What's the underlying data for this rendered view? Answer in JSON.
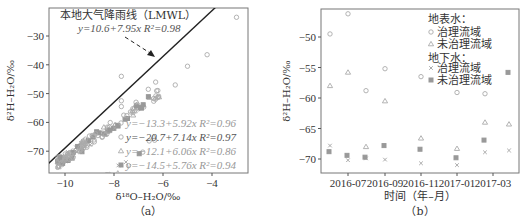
{
  "chart_data": [
    {
      "panel": "a",
      "type": "scatter",
      "panel_label": "（a）",
      "xlabel": "δ¹⁸O–H₂O/‰",
      "ylabel": "δ²H–H₂O/‰",
      "xlim": [
        -10.7,
        -2.6
      ],
      "ylim": [
        -76,
        -21
      ],
      "xticks": [
        "-10",
        "-8",
        "-6",
        "-4"
      ],
      "yticks": [
        "-30",
        "-40",
        "-50",
        "-60",
        "-70"
      ],
      "lmwl": {
        "label": "本地大气降雨线（LMWL）",
        "equation": "y=10.6+7.95x",
        "r2": "R²=0.98",
        "intercept": 10.6,
        "slope": 7.95
      },
      "regressions": [
        {
          "equation": "y=−13.3+5.92x",
          "r2": "R²=0.96",
          "intercept": -13.3,
          "slope": 5.92,
          "marker": "circle"
        },
        {
          "equation": "y=−20.7+7.14x",
          "r2": "R²=0.97",
          "intercept": -20.7,
          "slope": 7.14,
          "marker": "circle"
        },
        {
          "equation": "y=−12.1+6.06x",
          "r2": "R²=0.86",
          "intercept": -12.1,
          "slope": 6.06,
          "marker": "triangle"
        },
        {
          "equation": "y=−14.5+5.76x",
          "r2": "R²=0.94",
          "intercept": -14.5,
          "slope": 5.76,
          "marker": "square"
        }
      ],
      "points_note": "Dense cluster of ~200 grey markers along slope ~6-7 from (-10.3,-75) to (-3,-23)"
    },
    {
      "panel": "b",
      "type": "scatter",
      "panel_label": "（b）",
      "xlabel": "时间（年–月）",
      "ylabel": "δ²H–H₂O/‰",
      "ylim": [
        -72,
        -45
      ],
      "xticks": [
        "2016-07",
        "2016-09",
        "2016-11",
        "2017-01",
        "2017-03"
      ],
      "yticks": [
        "-50",
        "-55",
        "-60",
        "-65",
        "-70"
      ],
      "legend": {
        "group1_title": "地表水：",
        "group1_items": [
          "治理流域",
          "未治理流域"
        ],
        "group2_title": "地下水：",
        "group2_items": [
          "治理流域",
          "未治理流域"
        ]
      },
      "x": [
        "2016-06",
        "2016-07",
        "2016-08",
        "2016-09",
        "2016-11",
        "2017-01",
        "2017-02",
        "2017-03"
      ],
      "series": [
        {
          "name": "地表水-治理流域",
          "marker": "circle",
          "values": [
            -49.5,
            -46.2,
            -58.8,
            -55.2,
            -56.5,
            -59.1,
            -59.3,
            null
          ]
        },
        {
          "name": "地表水-未治理流域",
          "marker": "triangle",
          "values": [
            -58.0,
            -55.8,
            -68.0,
            -60.5,
            -66.6,
            -68.3,
            -64.0,
            -64.3
          ]
        },
        {
          "name": "地下水-治理流域",
          "marker": "cross",
          "values": [
            -67.8,
            -70.2,
            -69.9,
            -70.1,
            -70.7,
            -71.0,
            -68.9,
            -68.6
          ]
        },
        {
          "name": "地下水-未治理流域",
          "marker": "square",
          "values": [
            -68.8,
            -69.4,
            -69.7,
            -67.8,
            -68.4,
            -69.8,
            -66.9,
            -55.8
          ]
        }
      ]
    }
  ]
}
